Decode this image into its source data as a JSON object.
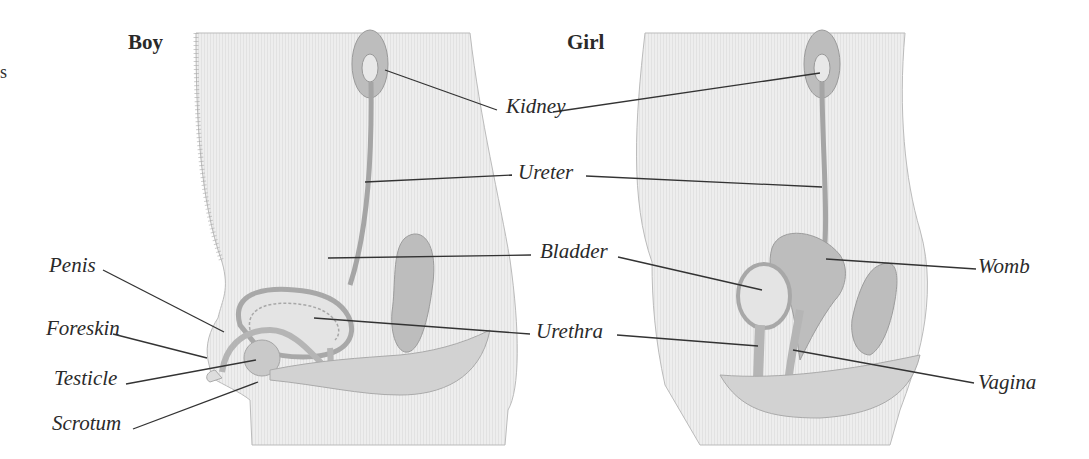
{
  "figure": {
    "panels": [
      {
        "title": "Boy"
      },
      {
        "title": "Girl"
      }
    ],
    "edge_fragment": "s",
    "shared_labels": {
      "kidney": "Kidney",
      "ureter": "Ureter",
      "bladder": "Bladder",
      "urethra": "Urethra"
    },
    "boy_labels": {
      "penis": "Penis",
      "foreskin": "Foreskin",
      "testicle": "Testicle",
      "scrotum": "Scrotum"
    },
    "girl_labels": {
      "womb": "Womb",
      "vagina": "Vagina"
    },
    "colors": {
      "body_fill": "#ececec",
      "organ_fill": "#bdbdbd",
      "organ_stroke": "#9a9a9a",
      "leader_line": "#333333",
      "background": "#ffffff"
    }
  }
}
